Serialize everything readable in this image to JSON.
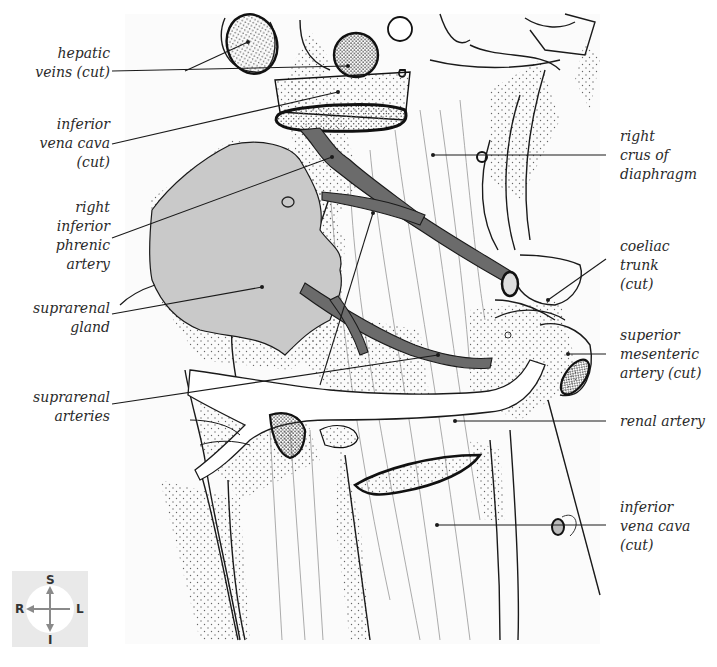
{
  "figure": {
    "type": "anatomical-illustration",
    "colors": {
      "line": "#1a1a1a",
      "artery_fill": "#6b6b6b",
      "gland_fill": "#c9c9c9",
      "stipple": "#555555",
      "label_text": "#2a2a2a",
      "compass_bg": "#e9e9e9",
      "compass_arrow": "#8a8a8a"
    }
  },
  "labels_left": [
    {
      "id": "hepatic-veins",
      "lines": [
        "hepatic",
        "veins (cut)"
      ]
    },
    {
      "id": "ivc-upper",
      "lines": [
        "inferior",
        "vena cava",
        "(cut)"
      ]
    },
    {
      "id": "right-inferior-phrenic-artery",
      "lines": [
        "right",
        "inferior",
        "phrenic",
        "artery"
      ]
    },
    {
      "id": "suprarenal-gland",
      "lines": [
        "suprarenal",
        "gland"
      ]
    },
    {
      "id": "suprarenal-arteries",
      "lines": [
        "suprarenal",
        "arteries"
      ]
    }
  ],
  "labels_right": [
    {
      "id": "right-crus",
      "lines": [
        "right",
        "crus of",
        "diaphragm"
      ]
    },
    {
      "id": "coeliac-trunk",
      "lines": [
        "coeliac",
        "trunk",
        "(cut)"
      ]
    },
    {
      "id": "superior-mesenteric-artery",
      "lines": [
        "superior",
        "mesenteric",
        "artery (cut)"
      ]
    },
    {
      "id": "renal-artery",
      "lines": [
        "renal artery"
      ]
    },
    {
      "id": "ivc-lower",
      "lines": [
        "inferior",
        "vena cava",
        "(cut)"
      ]
    }
  ],
  "orientation_compass": {
    "superior": "S",
    "inferior": "I",
    "right": "R",
    "left": "L"
  }
}
